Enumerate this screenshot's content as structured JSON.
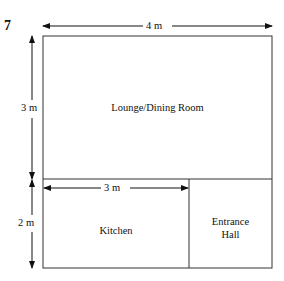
{
  "question_number": "7",
  "dimensions": {
    "total_width": "4 m",
    "lounge_height": "3 m",
    "kitchen_height": "2 m",
    "kitchen_width": "3 m"
  },
  "rooms": {
    "lounge": "Lounge/Dining Room",
    "kitchen": "Kitchen",
    "entrance_line1": "Entrance",
    "entrance_line2": "Hall"
  }
}
